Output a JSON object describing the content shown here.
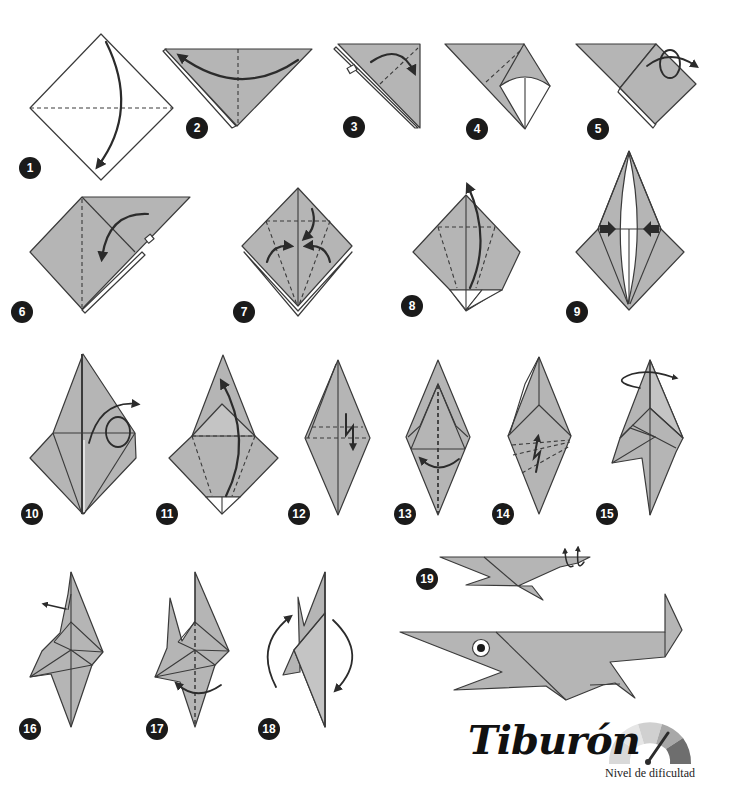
{
  "title": "Tiburón",
  "difficulty": {
    "label": "Nivel de dificultad",
    "segments": 5,
    "level_segment": 4,
    "colors": [
      "#d9d9d9",
      "#e6e6e6",
      "#d0d0d0",
      "#a8a8a8",
      "#6e6e6e"
    ],
    "needle_color": "#2b2b2b"
  },
  "colors": {
    "paper": "#b5b5b5",
    "outline": "#3a3a3a",
    "badge": "#1a1a1a",
    "badge_text": "#ffffff",
    "background": "#ffffff"
  },
  "steps": [
    {
      "number": "1"
    },
    {
      "number": "2"
    },
    {
      "number": "3"
    },
    {
      "number": "4"
    },
    {
      "number": "5"
    },
    {
      "number": "6"
    },
    {
      "number": "7"
    },
    {
      "number": "8"
    },
    {
      "number": "9"
    },
    {
      "number": "10"
    },
    {
      "number": "11"
    },
    {
      "number": "12"
    },
    {
      "number": "13"
    },
    {
      "number": "14"
    },
    {
      "number": "15"
    },
    {
      "number": "16"
    },
    {
      "number": "17"
    },
    {
      "number": "18"
    },
    {
      "number": "19"
    }
  ]
}
